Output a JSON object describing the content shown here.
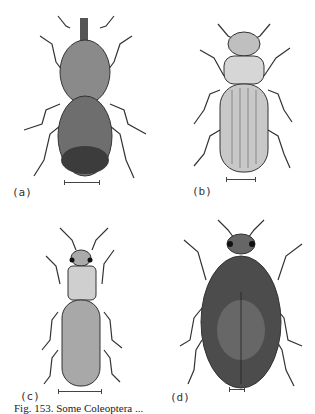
{
  "figure": {
    "panels": [
      {
        "id": "a",
        "label": "(a)",
        "subject": "weevil-beetle",
        "scale_bar": true
      },
      {
        "id": "b",
        "label": "(b)",
        "subject": "flat-grain-beetle",
        "scale_bar": true
      },
      {
        "id": "c",
        "label": "(c)",
        "subject": "saw-toothed-grain-beetle",
        "scale_bar": true
      },
      {
        "id": "d",
        "label": "(d)",
        "subject": "round-oval-beetle",
        "scale_bar": true
      }
    ],
    "caption": "Fig. 153.  Some Coleoptera ..."
  }
}
